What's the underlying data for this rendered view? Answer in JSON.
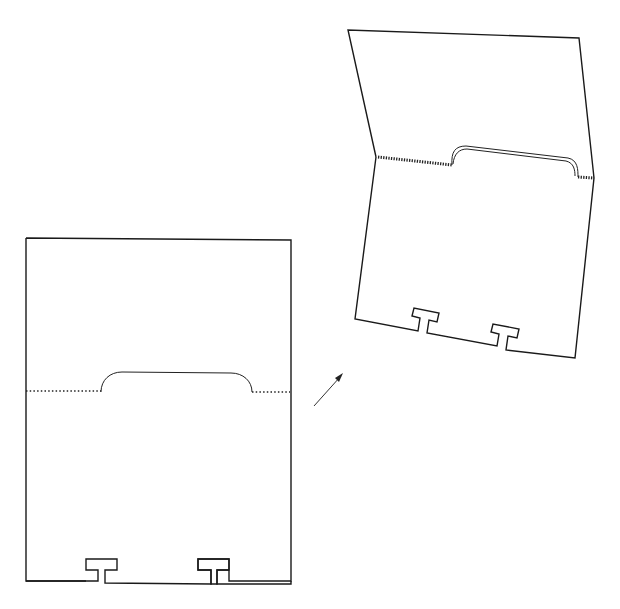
{
  "figure": {
    "views": [
      {
        "name": "flat-card",
        "label": ""
      },
      {
        "name": "folded-card",
        "label": ""
      }
    ],
    "arrow": {
      "direction": "up-right"
    },
    "colors": {
      "line": "#1a1a1a",
      "background": "#ffffff"
    }
  }
}
